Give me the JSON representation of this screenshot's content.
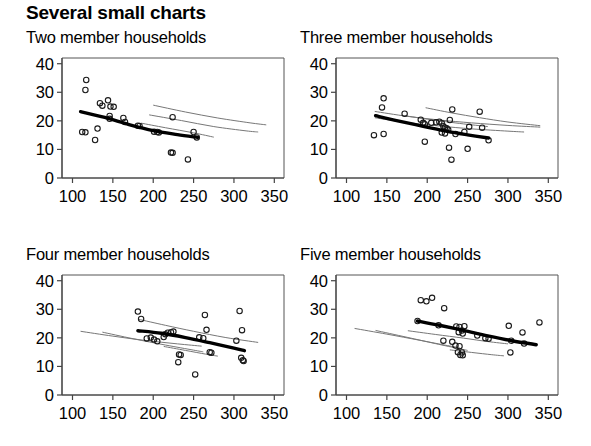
{
  "title": "Several small charts",
  "axis": {
    "x_ticks": [
      100,
      150,
      200,
      250,
      300,
      350
    ],
    "y_ticks": [
      0,
      10,
      20,
      30,
      40
    ],
    "xlim": [
      87,
      362
    ],
    "ylim": [
      0,
      42
    ]
  },
  "chart_data": [
    {
      "type": "scatter",
      "title": "Two member households",
      "xlabel": "",
      "ylabel": "",
      "xlim": [
        87,
        362
      ],
      "ylim": [
        0,
        42
      ],
      "xticks": [
        100,
        150,
        200,
        250,
        300,
        350
      ],
      "yticks": [
        0,
        10,
        20,
        30,
        40
      ],
      "grid": false,
      "legend": "none",
      "points": [
        [
          117,
          34.3
        ],
        [
          116,
          30.8
        ],
        [
          144,
          27.2
        ],
        [
          134,
          26.2
        ],
        [
          137,
          25.3
        ],
        [
          147,
          25.0
        ],
        [
          151,
          24.9
        ],
        [
          146,
          21.7
        ],
        [
          146,
          20.7
        ],
        [
          163,
          21.0
        ],
        [
          165,
          19.6
        ],
        [
          112,
          16.1
        ],
        [
          116,
          16.0
        ],
        [
          131,
          17.3
        ],
        [
          128,
          13.3
        ],
        [
          181,
          18.3
        ],
        [
          183,
          18.2
        ],
        [
          201,
          16.2
        ],
        [
          205,
          16.1
        ],
        [
          207,
          15.9
        ],
        [
          224,
          21.3
        ],
        [
          250,
          16.1
        ],
        [
          254,
          14.2
        ],
        [
          222,
          8.9
        ],
        [
          224,
          8.8
        ],
        [
          243,
          6.5
        ]
      ],
      "fit_curve": [
        [
          110,
          23.2
        ],
        [
          140,
          21.2
        ],
        [
          170,
          18.7
        ],
        [
          200,
          16.6
        ],
        [
          230,
          15.2
        ],
        [
          255,
          14.2
        ]
      ],
      "ref_curves": [
        [
          [
            200,
            25.5
          ],
          [
            240,
            23.1
          ],
          [
            280,
            21.0
          ],
          [
            320,
            19.3
          ],
          [
            340,
            18.6
          ]
        ],
        [
          [
            195,
            22.1
          ],
          [
            235,
            20.1
          ],
          [
            275,
            18.0
          ],
          [
            315,
            16.5
          ],
          [
            330,
            16.1
          ]
        ],
        [
          [
            185,
            19.2
          ],
          [
            215,
            17.6
          ],
          [
            250,
            15.8
          ],
          [
            275,
            14.3
          ]
        ]
      ]
    },
    {
      "type": "scatter",
      "title": "Three member households",
      "xlabel": "",
      "ylabel": "",
      "xlim": [
        87,
        362
      ],
      "ylim": [
        0,
        42
      ],
      "xticks": [
        100,
        150,
        200,
        250,
        300,
        350
      ],
      "yticks": [
        0,
        10,
        20,
        30,
        40
      ],
      "grid": false,
      "legend": "none",
      "points": [
        [
          146,
          27.9
        ],
        [
          144,
          24.7
        ],
        [
          172,
          22.5
        ],
        [
          192,
          20.4
        ],
        [
          195,
          19.3
        ],
        [
          197,
          18.8
        ],
        [
          205,
          19.3
        ],
        [
          211,
          19.5
        ],
        [
          215,
          19.7
        ],
        [
          218,
          19.2
        ],
        [
          220,
          18.1
        ],
        [
          222,
          17.6
        ],
        [
          224,
          17.4
        ],
        [
          226,
          16.9
        ],
        [
          231,
          24.0
        ],
        [
          228,
          20.3
        ],
        [
          218,
          15.9
        ],
        [
          222,
          15.6
        ],
        [
          235,
          15.4
        ],
        [
          246,
          16.1
        ],
        [
          252,
          17.9
        ],
        [
          265,
          23.2
        ],
        [
          268,
          17.6
        ],
        [
          276,
          13.2
        ],
        [
          134,
          15.0
        ],
        [
          146,
          15.4
        ],
        [
          197,
          12.7
        ],
        [
          227,
          10.6
        ],
        [
          250,
          10.2
        ],
        [
          230,
          6.4
        ]
      ],
      "fit_curve": [
        [
          136,
          21.8
        ],
        [
          165,
          19.9
        ],
        [
          195,
          18.1
        ],
        [
          225,
          16.3
        ],
        [
          250,
          15.1
        ],
        [
          276,
          14.0
        ]
      ],
      "ref_curves": [
        [
          [
            135,
            23.3
          ],
          [
            175,
            21.6
          ],
          [
            215,
            20.3
          ],
          [
            255,
            19.3
          ],
          [
            300,
            18.4
          ],
          [
            340,
            17.8
          ]
        ],
        [
          [
            135,
            21.1
          ],
          [
            175,
            19.4
          ],
          [
            215,
            18.2
          ],
          [
            255,
            17.2
          ],
          [
            300,
            16.4
          ],
          [
            320,
            16.1
          ]
        ],
        [
          [
            198,
            24.6
          ],
          [
            230,
            22.8
          ],
          [
            265,
            21.1
          ],
          [
            300,
            19.6
          ],
          [
            340,
            18.3
          ]
        ],
        [
          [
            172,
            21.8
          ],
          [
            205,
            20.4
          ],
          [
            240,
            19.1
          ],
          [
            275,
            18.0
          ]
        ]
      ]
    },
    {
      "type": "scatter",
      "title": "Four member households",
      "xlabel": "",
      "ylabel": "",
      "xlim": [
        87,
        362
      ],
      "ylim": [
        0,
        42
      ],
      "xticks": [
        100,
        150,
        200,
        250,
        300,
        350
      ],
      "yticks": [
        0,
        10,
        20,
        30,
        40
      ],
      "grid": false,
      "legend": "none",
      "points": [
        [
          181,
          29.2
        ],
        [
          185,
          26.6
        ],
        [
          192,
          19.8
        ],
        [
          197,
          20.1
        ],
        [
          201,
          19.4
        ],
        [
          205,
          18.8
        ],
        [
          215,
          21.3
        ],
        [
          218,
          21.8
        ],
        [
          222,
          22.0
        ],
        [
          225,
          22.2
        ],
        [
          213,
          20.3
        ],
        [
          232,
          14.2
        ],
        [
          234,
          14.0
        ],
        [
          231,
          11.5
        ],
        [
          252,
          7.2
        ],
        [
          257,
          20.2
        ],
        [
          262,
          19.9
        ],
        [
          264,
          28.0
        ],
        [
          266,
          22.8
        ],
        [
          270,
          15.0
        ],
        [
          272,
          14.8
        ],
        [
          303,
          19.0
        ],
        [
          307,
          29.4
        ],
        [
          310,
          22.7
        ],
        [
          309,
          13.0
        ],
        [
          311,
          12.2
        ],
        [
          312,
          11.9
        ]
      ],
      "fit_curve": [
        [
          181,
          22.5
        ],
        [
          210,
          21.6
        ],
        [
          240,
          20.1
        ],
        [
          270,
          18.3
        ],
        [
          300,
          16.4
        ],
        [
          313,
          15.5
        ]
      ],
      "ref_curves": [
        [
          [
            110,
            22.3
          ],
          [
            150,
            20.6
          ],
          [
            190,
            19.1
          ],
          [
            230,
            17.9
          ],
          [
            260,
            17.1
          ]
        ],
        [
          [
            137,
            22.0
          ],
          [
            175,
            19.7
          ],
          [
            215,
            17.5
          ],
          [
            250,
            15.7
          ],
          [
            262,
            15.1
          ]
        ],
        [
          [
            182,
            26.5
          ],
          [
            215,
            24.4
          ],
          [
            250,
            22.3
          ],
          [
            290,
            20.1
          ],
          [
            330,
            18.4
          ]
        ],
        [
          [
            213,
            17.0
          ],
          [
            240,
            15.6
          ],
          [
            265,
            14.3
          ],
          [
            280,
            13.6
          ]
        ]
      ]
    },
    {
      "type": "scatter",
      "title": "Five member households",
      "xlabel": "",
      "ylabel": "",
      "xlim": [
        87,
        362
      ],
      "ylim": [
        0,
        42
      ],
      "xticks": [
        100,
        150,
        200,
        250,
        300,
        350
      ],
      "yticks": [
        0,
        10,
        20,
        30,
        40
      ],
      "grid": false,
      "legend": "none",
      "points": [
        [
          192,
          33.2
        ],
        [
          199,
          32.8
        ],
        [
          206,
          34.0
        ],
        [
          221,
          30.4
        ],
        [
          188,
          25.9
        ],
        [
          214,
          24.4
        ],
        [
          236,
          24.0
        ],
        [
          240,
          23.8
        ],
        [
          246,
          24.1
        ],
        [
          243,
          22.6
        ],
        [
          239,
          22.0
        ],
        [
          244,
          21.5
        ],
        [
          220,
          19.0
        ],
        [
          231,
          18.6
        ],
        [
          235,
          17.3
        ],
        [
          240,
          17.1
        ],
        [
          262,
          20.8
        ],
        [
          272,
          19.9
        ],
        [
          276,
          19.7
        ],
        [
          238,
          15.0
        ],
        [
          243,
          14.9
        ],
        [
          241,
          14.0
        ],
        [
          244,
          13.9
        ],
        [
          301,
          24.2
        ],
        [
          304,
          19.0
        ],
        [
          303,
          14.9
        ],
        [
          318,
          21.9
        ],
        [
          320,
          18.0
        ],
        [
          339,
          25.4
        ]
      ],
      "fit_curve": [
        [
          188,
          25.9
        ],
        [
          215,
          24.4
        ],
        [
          245,
          22.6
        ],
        [
          275,
          20.7
        ],
        [
          305,
          19.0
        ],
        [
          335,
          17.6
        ]
      ],
      "ref_curves": [
        [
          [
            110,
            23.3
          ],
          [
            150,
            21.3
          ],
          [
            190,
            19.2
          ],
          [
            225,
            17.3
          ],
          [
            240,
            16.6
          ]
        ],
        [
          [
            136,
            22.6
          ],
          [
            175,
            20.2
          ],
          [
            210,
            18.0
          ],
          [
            240,
            16.2
          ],
          [
            250,
            15.6
          ]
        ],
        [
          [
            176,
            22.5
          ],
          [
            210,
            21.2
          ],
          [
            245,
            19.9
          ],
          [
            275,
            18.7
          ],
          [
            300,
            17.9
          ]
        ],
        [
          [
            228,
            15.8
          ],
          [
            255,
            14.9
          ],
          [
            280,
            14.1
          ],
          [
            295,
            13.7
          ]
        ]
      ]
    }
  ]
}
